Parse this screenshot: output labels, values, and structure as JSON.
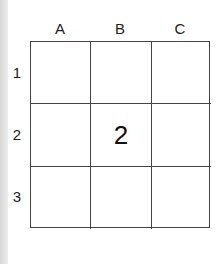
{
  "columns": [
    "A",
    "B",
    "C"
  ],
  "rows": [
    "1",
    "2",
    "3"
  ],
  "cells": [
    [
      "",
      "",
      ""
    ],
    [
      "",
      "2",
      ""
    ],
    [
      "",
      "",
      ""
    ]
  ]
}
